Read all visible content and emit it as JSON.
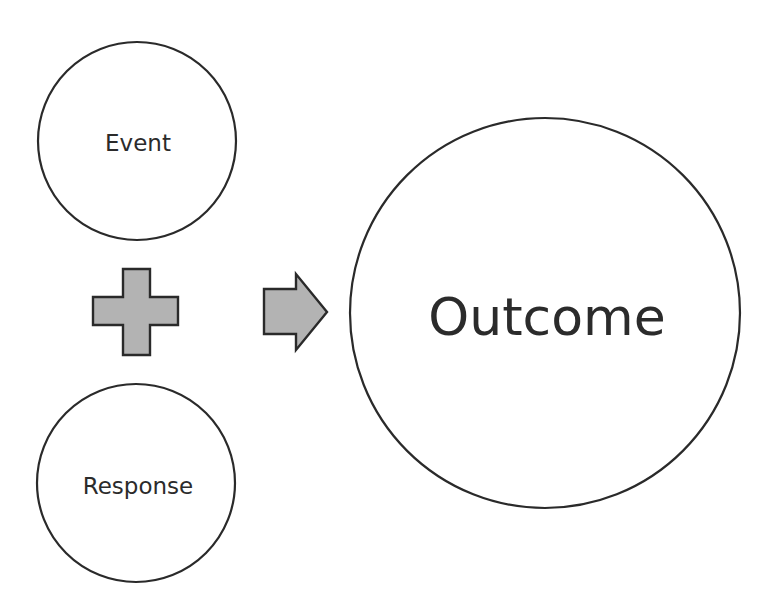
{
  "diagram": {
    "colors": {
      "background": "#ffffff",
      "stroke": "#2a2a2a",
      "text": "#2b2b2b",
      "operator_fill": "#b3b3b3"
    },
    "nodes": [
      {
        "id": "event",
        "label": "Event",
        "cx": 137,
        "cy": 141,
        "r": 99,
        "font_size": 23,
        "label_y": 151
      },
      {
        "id": "response",
        "label": "Response",
        "cx": 136,
        "cy": 483,
        "r": 99,
        "font_size": 23,
        "label_y": 494
      },
      {
        "id": "outcome",
        "label": "Outcome",
        "cx": 545,
        "cy": 313,
        "r": 195,
        "font_size": 52,
        "label_y": 335
      }
    ],
    "operators": [
      {
        "id": "plus",
        "symbol": "plus-icon",
        "meaning": "combined with"
      },
      {
        "id": "arrow",
        "symbol": "right-arrow-icon",
        "meaning": "leads to"
      }
    ]
  }
}
